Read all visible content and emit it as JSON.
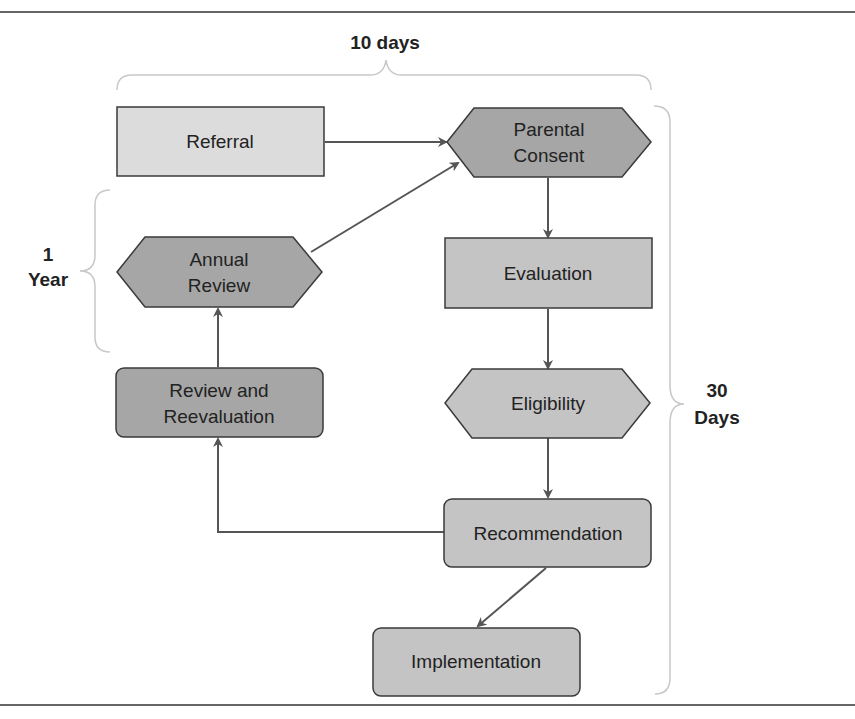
{
  "diagram": {
    "type": "flowchart",
    "colors": {
      "light_fill": "#dcdcdc",
      "mid_fill": "#c4c4c4",
      "dark_fill": "#a6a6a6",
      "stroke": "#3a3a3a",
      "arrow": "#555555",
      "brace": "#c8c8c8",
      "rule": "#333333"
    },
    "timespans": {
      "top": {
        "label": "10 days"
      },
      "left_line1": "1",
      "left_line2": "Year",
      "right_line1": "30",
      "right_line2": "Days"
    },
    "nodes": {
      "referral": {
        "label": "Referral"
      },
      "parental_consent": {
        "line1": "Parental",
        "line2": "Consent"
      },
      "annual_review": {
        "line1": "Annual",
        "line2": "Review"
      },
      "evaluation": {
        "label": "Evaluation"
      },
      "review_reevaluation": {
        "line1": "Review and",
        "line2": "Reevaluation"
      },
      "eligibility": {
        "label": "Eligibility"
      },
      "recommendation": {
        "label": "Recommendation"
      },
      "implementation": {
        "label": "Implementation"
      }
    },
    "edges": [
      {
        "from": "Referral",
        "to": "Parental Consent"
      },
      {
        "from": "Annual Review",
        "to": "Parental Consent"
      },
      {
        "from": "Parental Consent",
        "to": "Evaluation"
      },
      {
        "from": "Evaluation",
        "to": "Eligibility"
      },
      {
        "from": "Eligibility",
        "to": "Recommendation"
      },
      {
        "from": "Recommendation",
        "to": "Review and Reevaluation"
      },
      {
        "from": "Review and Reevaluation",
        "to": "Annual Review"
      },
      {
        "from": "Recommendation",
        "to": "Implementation"
      }
    ]
  }
}
